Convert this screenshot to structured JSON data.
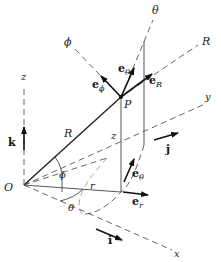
{
  "diagram": {
    "origin_label": "O",
    "point_label": "P",
    "axes": {
      "x": "x",
      "y": "y",
      "z": "z",
      "R_axis": "R",
      "theta_axis": "θ",
      "phi_axis": "ϕ"
    },
    "segments": {
      "R": "R",
      "r": "r",
      "z": "z"
    },
    "angles": {
      "phi": "ϕ",
      "theta": "θ"
    },
    "unit_vectors": {
      "i": "i",
      "j": "j",
      "k": "k",
      "e_R": {
        "base": "e",
        "sub": "R"
      },
      "e_theta": {
        "base": "e",
        "sub": "θ"
      },
      "e_phi": {
        "base": "e",
        "sub": "ϕ"
      },
      "e_r": {
        "base": "e",
        "sub": "r"
      },
      "e_theta_lower": {
        "base": "e",
        "sub": "θ"
      }
    }
  }
}
